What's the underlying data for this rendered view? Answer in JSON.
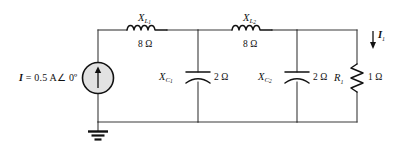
{
  "diagram": {
    "background_color": "#ffffff",
    "wire_color": "#3a3a3a",
    "component_color": "#111111",
    "source_fill_color": "#e2e2e2"
  },
  "source": {
    "name": "current-source",
    "label_prefix": "I",
    "label_equals": "=",
    "label_value": "0.5 A",
    "label_angle": "∠ 0º",
    "full_label": "I = 0.5 A ∠ 0º",
    "arrow_direction": "up"
  },
  "components": [
    {
      "id": "XL1",
      "type": "inductor",
      "symbol": "X",
      "subscript": "L₁",
      "symbol_html": "X",
      "value": "8 Ω",
      "orientation": "horizontal"
    },
    {
      "id": "XL2",
      "type": "inductor",
      "symbol": "X",
      "subscript": "L₂",
      "value": "8 Ω",
      "orientation": "horizontal"
    },
    {
      "id": "XC1",
      "type": "capacitor",
      "symbol": "X",
      "subscript": "C₁",
      "value": "2 Ω",
      "orientation": "vertical"
    },
    {
      "id": "XC2",
      "type": "capacitor",
      "symbol": "X",
      "subscript": "C₂",
      "value": "2 Ω",
      "orientation": "vertical"
    },
    {
      "id": "R1",
      "type": "resistor",
      "symbol": "R",
      "subscript": "1",
      "value": "1 Ω",
      "orientation": "vertical"
    }
  ],
  "labels": {
    "xl1_symbol": "X",
    "xl1_subscript": "L",
    "xl1_subscript_index": "1",
    "xl1_value": "8 Ω",
    "xl2_symbol": "X",
    "xl2_subscript": "L",
    "xl2_subscript_index": "2",
    "xl2_value": "8 Ω",
    "xc1_symbol": "X",
    "xc1_subscript": "C",
    "xc1_subscript_index": "1",
    "xc1_value": "2 Ω",
    "xc2_symbol": "X",
    "xc2_subscript": "C",
    "xc2_subscript_index": "2",
    "xc2_value": "2 Ω",
    "r1_symbol": "R",
    "r1_subscript_index": "1",
    "r1_value": "1 Ω",
    "branch_current_symbol": "I",
    "branch_current_subscript": "1"
  },
  "annotations": {
    "branch_current": {
      "name": "branch-current-I1",
      "label": "I₁",
      "direction": "down",
      "location": "right branch through R1"
    },
    "ground": {
      "name": "ground-symbol",
      "label": "",
      "location": "below current source"
    }
  }
}
